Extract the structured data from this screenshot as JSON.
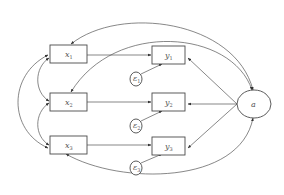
{
  "diagram": {
    "type": "path-model",
    "colors": {
      "stroke": "#4a4a4a",
      "text": "#555555",
      "background": "#ffffff"
    },
    "nodes": {
      "x1": {
        "label": "x",
        "sub": "1",
        "shape": "rect"
      },
      "x2": {
        "label": "x",
        "sub": "2",
        "shape": "rect"
      },
      "x3": {
        "label": "x",
        "sub": "3",
        "shape": "rect"
      },
      "y1": {
        "label": "y",
        "sub": "1",
        "shape": "rect"
      },
      "y2": {
        "label": "y",
        "sub": "2",
        "shape": "rect"
      },
      "y3": {
        "label": "y",
        "sub": "3",
        "shape": "rect"
      },
      "e1": {
        "label": "ε",
        "sub": "1",
        "shape": "circle"
      },
      "e2": {
        "label": "ε",
        "sub": "2",
        "shape": "circle"
      },
      "e3": {
        "label": "ε",
        "sub": "3",
        "shape": "circle"
      },
      "a": {
        "label": "a",
        "shape": "ellipse"
      }
    },
    "edges": [
      {
        "from": "x1",
        "to": "y1",
        "type": "directed"
      },
      {
        "from": "x2",
        "to": "y2",
        "type": "directed"
      },
      {
        "from": "x3",
        "to": "y3",
        "type": "directed"
      },
      {
        "from": "e1",
        "to": "y1",
        "type": "directed"
      },
      {
        "from": "e2",
        "to": "y2",
        "type": "directed"
      },
      {
        "from": "e3",
        "to": "y3",
        "type": "directed"
      },
      {
        "from": "a",
        "to": "y1",
        "type": "directed"
      },
      {
        "from": "a",
        "to": "y2",
        "type": "directed"
      },
      {
        "from": "a",
        "to": "y3",
        "type": "directed"
      },
      {
        "from": "x1",
        "to": "x2",
        "type": "covariance"
      },
      {
        "from": "x2",
        "to": "x3",
        "type": "covariance"
      },
      {
        "from": "x1",
        "to": "x3",
        "type": "covariance"
      },
      {
        "from": "a",
        "to": "x1",
        "type": "covariance"
      },
      {
        "from": "a",
        "to": "x2",
        "type": "covariance"
      },
      {
        "from": "a",
        "to": "x3",
        "type": "covariance"
      }
    ]
  }
}
